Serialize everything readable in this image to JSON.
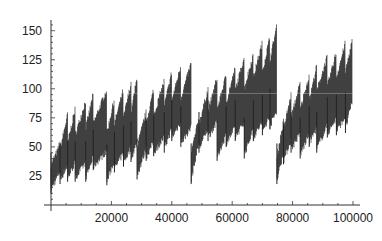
{
  "chart_data": {
    "type": "scatter",
    "title": "",
    "xlabel": "",
    "ylabel": "",
    "xlim": [
      0,
      100000
    ],
    "ylim": [
      0,
      160
    ],
    "grid": false,
    "legend": null,
    "x_ticks": [
      20000,
      40000,
      60000,
      80000,
      100000
    ],
    "x_tick_labels": [
      "20000",
      "40000",
      "60000",
      "80000",
      "100000"
    ],
    "y_ticks": [
      25,
      50,
      75,
      100,
      125,
      150
    ],
    "y_tick_labels": [
      "25",
      "50",
      "75",
      "100",
      "125",
      "150"
    ],
    "marker_color": "#111111",
    "major_segments": [
      {
        "x_start": 0,
        "x_end": 28500,
        "min_start": 10,
        "min_end": 40,
        "max_start": 55,
        "max_end": 110
      },
      {
        "x_start": 28500,
        "x_end": 46400,
        "min_start": 25,
        "min_end": 50,
        "max_start": 85,
        "max_end": 125
      },
      {
        "x_start": 46400,
        "x_end": 74800,
        "min_start": 25,
        "min_end": 65,
        "max_start": 90,
        "max_end": 155
      },
      {
        "x_start": 74800,
        "x_end": 100000,
        "min_start": 22,
        "min_end": 60,
        "max_start": 75,
        "max_end": 145
      }
    ],
    "teeth": [
      {
        "x": 0,
        "low": 10,
        "high": 55
      },
      {
        "x": 3000,
        "low": 18,
        "high": 78
      },
      {
        "x": 5500,
        "low": 20,
        "high": 83
      },
      {
        "x": 8000,
        "low": 20,
        "high": 90
      },
      {
        "x": 11500,
        "low": 20,
        "high": 96
      },
      {
        "x": 14000,
        "low": 30,
        "high": 100
      },
      {
        "x": 18500,
        "low": 17,
        "high": 92
      },
      {
        "x": 21000,
        "low": 28,
        "high": 100
      },
      {
        "x": 24000,
        "low": 33,
        "high": 105
      },
      {
        "x": 26500,
        "low": 37,
        "high": 110
      },
      {
        "x": 28500,
        "low": 22,
        "high": 80
      },
      {
        "x": 31500,
        "low": 38,
        "high": 100
      },
      {
        "x": 34000,
        "low": 42,
        "high": 107
      },
      {
        "x": 37500,
        "low": 45,
        "high": 115
      },
      {
        "x": 40000,
        "low": 55,
        "high": 120
      },
      {
        "x": 43000,
        "low": 50,
        "high": 122
      },
      {
        "x": 46400,
        "low": 18,
        "high": 75
      },
      {
        "x": 49000,
        "low": 45,
        "high": 100
      },
      {
        "x": 52000,
        "low": 55,
        "high": 110
      },
      {
        "x": 55000,
        "low": 38,
        "high": 112
      },
      {
        "x": 58000,
        "low": 50,
        "high": 118
      },
      {
        "x": 61000,
        "low": 55,
        "high": 128
      },
      {
        "x": 64000,
        "low": 40,
        "high": 130
      },
      {
        "x": 67000,
        "low": 55,
        "high": 140
      },
      {
        "x": 70000,
        "low": 60,
        "high": 145
      },
      {
        "x": 72500,
        "low": 65,
        "high": 155
      },
      {
        "x": 74800,
        "low": 18,
        "high": 72
      },
      {
        "x": 77000,
        "low": 35,
        "high": 95
      },
      {
        "x": 79500,
        "low": 45,
        "high": 105
      },
      {
        "x": 82500,
        "low": 40,
        "high": 112
      },
      {
        "x": 85500,
        "low": 50,
        "high": 120
      },
      {
        "x": 88000,
        "low": 45,
        "high": 128
      },
      {
        "x": 91500,
        "low": 58,
        "high": 132
      },
      {
        "x": 94500,
        "low": 60,
        "high": 140
      },
      {
        "x": 97500,
        "low": 62,
        "high": 145
      }
    ]
  }
}
